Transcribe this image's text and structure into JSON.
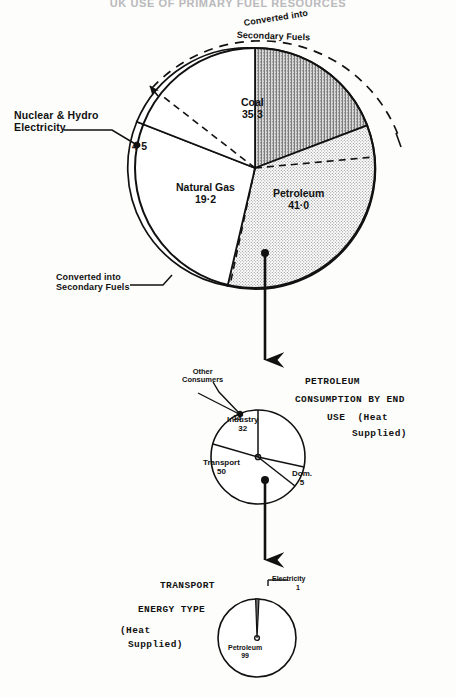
{
  "page": {
    "title": "UK USE OF PRIMARY FUEL RESOURCES"
  },
  "chart_data": [
    {
      "id": "primary-fuel-pie",
      "type": "pie",
      "title": "UK USE OF PRIMARY FUEL RESOURCES",
      "unit": "percent",
      "categories": [
        "Coal",
        "Petroleum",
        "Natural Gas",
        "Nuclear & Hydro Electricity"
      ],
      "values": [
        35.3,
        41.0,
        19.2,
        4.5
      ],
      "labels": {
        "coal_name": "Coal",
        "coal_value": "35·3",
        "petroleum_name": "Petroleum",
        "petroleum_value": "41·0",
        "gas_name": "Natural Gas",
        "gas_value": "19·2",
        "nuclear_name": "Nuclear & Hydro\nElectricity",
        "nuclear_value": "4·5"
      },
      "annotations": {
        "converted_top_line1": "Converted into",
        "converted_top_line2": "Secondary Fuels",
        "converted_bottom_line1": "Converted into",
        "converted_bottom_line2": "Secondary Fuels"
      }
    },
    {
      "id": "petroleum-end-use-pie",
      "type": "pie",
      "title": "PETROLEUM CONSUMPTION BY END USE (Heat Supplied)",
      "unit": "percent",
      "categories": [
        "Industry",
        "Dom.",
        "Transport",
        "Other Consumers"
      ],
      "values": [
        32,
        5,
        50,
        13
      ],
      "labels": {
        "industry_name": "Industry",
        "industry_value": "32",
        "dom_name": "Dom.",
        "dom_value": "5",
        "transport_name": "Transport",
        "transport_value": "50",
        "other_name": "Other\nConsumers",
        "other_value": "13"
      },
      "heading": {
        "line1": "PETROLEUM",
        "line2": "CONSUMPTION BY END",
        "line3": "USE  (Heat",
        "line4": "Supplied)"
      }
    },
    {
      "id": "transport-energy-type-pie",
      "type": "pie",
      "title": "TRANSPORT ENERGY TYPE (Heat Supplied)",
      "unit": "percent",
      "categories": [
        "Petroleum",
        "Electricity"
      ],
      "values": [
        99,
        1
      ],
      "labels": {
        "petroleum_name": "Petroleum",
        "petroleum_value": "99",
        "electricity_name": "Electricity",
        "electricity_value": "1"
      },
      "heading": {
        "line1": "TRANSPORT",
        "line2": "ENERGY TYPE",
        "line3": "(Heat",
        "line4": "Supplied)"
      }
    }
  ],
  "colors": {
    "ink": "#111111",
    "paper": "#fdfdfb",
    "coal_fill": "#9a9a9a",
    "petroleum_fill": "#c9c9c9",
    "title_faded": "#b9b9bc"
  }
}
